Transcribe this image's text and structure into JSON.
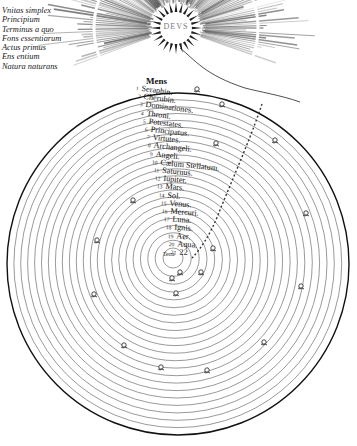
{
  "figure": {
    "center_label": "DEVS",
    "top_sphere_label": "Mens",
    "innermost_label": "Terra"
  },
  "divine_attributes": [
    "Vnitas simplex",
    "Principium",
    "Terminus a quo",
    "Fons essentiarum",
    "Actus primus",
    "Ens entium",
    "Natura naturans"
  ],
  "spheres": [
    {
      "num": "1",
      "label": "Seraphin."
    },
    {
      "num": "2",
      "label": "Cherubin."
    },
    {
      "num": "3",
      "label": "Dominationes."
    },
    {
      "num": "4",
      "label": "Throni."
    },
    {
      "num": "5",
      "label": "Potestates."
    },
    {
      "num": "6",
      "label": "Principatus."
    },
    {
      "num": "7",
      "label": "Virtutes."
    },
    {
      "num": "8",
      "label": "Archangeli."
    },
    {
      "num": "9",
      "label": "Angeli."
    },
    {
      "num": "10",
      "label": "Cælum Stellatum."
    },
    {
      "num": "11",
      "label": "Saturnus."
    },
    {
      "num": "12",
      "label": "Iupiter."
    },
    {
      "num": "13",
      "label": "Mars."
    },
    {
      "num": "14",
      "label": "Sol."
    },
    {
      "num": "15",
      "label": "Venus."
    },
    {
      "num": "16",
      "label": "Mercuri."
    },
    {
      "num": "17",
      "label": "Luna."
    },
    {
      "num": "18",
      "label": "Ignis."
    },
    {
      "num": "19",
      "label": "Aer."
    },
    {
      "num": "20",
      "label": "Aqua."
    },
    {
      "num": "21",
      "label": "22"
    }
  ],
  "colors": {
    "ink": "#111111",
    "rays": "#555555",
    "paper": "#ffffff"
  }
}
